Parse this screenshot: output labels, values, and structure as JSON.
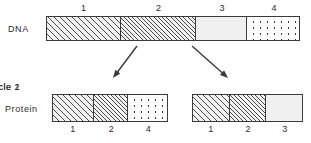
{
  "figure": {
    "rows": {
      "dna_label": "DNA",
      "protein_label": "Protein"
    },
    "dna": {
      "segments": [
        {
          "id": "1",
          "label": "1",
          "fill": "hatch-coarse",
          "width_pct": 29.5
        },
        {
          "id": "2",
          "label": "2",
          "fill": "hatch-fine",
          "width_pct": 29.5
        },
        {
          "id": "3",
          "label": "3",
          "fill": "plain",
          "width_pct": 20.5
        },
        {
          "id": "4",
          "label": "4",
          "fill": "dots",
          "width_pct": 20.5
        }
      ]
    },
    "proteins": [
      {
        "name": "muscle-1",
        "title": "Muscle  1",
        "segments": [
          {
            "id": "1",
            "label": "1",
            "fill": "hatch-coarse",
            "width_pct": 36
          },
          {
            "id": "2",
            "label": "2",
            "fill": "hatch-fine",
            "width_pct": 30
          },
          {
            "id": "4",
            "label": "4",
            "fill": "dots",
            "width_pct": 34
          }
        ]
      },
      {
        "name": "muscle-2",
        "title": "Muscle  2",
        "segments": [
          {
            "id": "1",
            "label": "1",
            "fill": "hatch-coarse",
            "width_pct": 34
          },
          {
            "id": "2",
            "label": "2",
            "fill": "hatch-fine",
            "width_pct": 33
          },
          {
            "id": "3",
            "label": "3",
            "fill": "plain",
            "width_pct": 33
          }
        ]
      }
    ],
    "arrows": [
      {
        "name": "arrow-to-muscle-1",
        "x1": 137,
        "y1": 46,
        "x2": 113,
        "y2": 78
      },
      {
        "name": "arrow-to-muscle-2",
        "x1": 192,
        "y1": 46,
        "x2": 228,
        "y2": 78
      }
    ],
    "colors": {
      "stroke": "#3a3a3a",
      "text": "#2b2b2b",
      "plain_fill": "#f0f0f0",
      "background": "#ffffff"
    }
  }
}
